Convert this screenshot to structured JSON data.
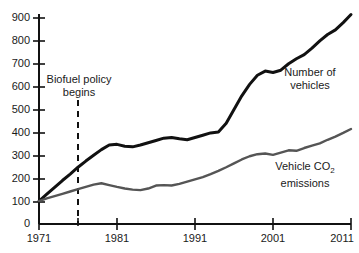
{
  "chart_data": {
    "type": "line",
    "title": "",
    "xlabel": "",
    "ylabel": "",
    "xlim": [
      1971,
      2011
    ],
    "ylim": [
      0,
      900
    ],
    "grid": false,
    "legend_position": "inline-right",
    "x_tick_labels": [
      "1971",
      "1981",
      "1991",
      "2001",
      "2011"
    ],
    "x_ticks": [
      1971,
      1981,
      1991,
      2001,
      2011
    ],
    "y_tick_labels": [
      "0",
      "100",
      "200",
      "300",
      "400",
      "500",
      "600",
      "700",
      "800",
      "900"
    ],
    "y_ticks": [
      0,
      100,
      200,
      300,
      400,
      500,
      600,
      700,
      800,
      900
    ],
    "x": [
      1971,
      1972,
      1973,
      1974,
      1975,
      1976,
      1977,
      1978,
      1979,
      1980,
      1981,
      1982,
      1983,
      1984,
      1985,
      1986,
      1987,
      1988,
      1989,
      1990,
      1991,
      1992,
      1993,
      1994,
      1995,
      1996,
      1997,
      1998,
      1999,
      2000,
      2001,
      2002,
      2003,
      2004,
      2005,
      2006,
      2007,
      2008,
      2009,
      2010,
      2011
    ],
    "series": [
      {
        "name": "Number of vehicles",
        "color": "#111111",
        "values": [
          100,
          130,
          160,
          190,
          218,
          248,
          275,
          300,
          325,
          345,
          348,
          340,
          337,
          345,
          355,
          365,
          375,
          378,
          372,
          368,
          378,
          388,
          398,
          402,
          440,
          500,
          560,
          610,
          650,
          668,
          662,
          672,
          700,
          722,
          740,
          768,
          800,
          828,
          848,
          880,
          915
        ]
      },
      {
        "name": "Vehicle CO2 emissions",
        "color": "#555555",
        "values": [
          100,
          112,
          122,
          132,
          142,
          152,
          162,
          172,
          178,
          170,
          162,
          155,
          150,
          148,
          155,
          168,
          170,
          168,
          175,
          185,
          195,
          205,
          218,
          232,
          248,
          265,
          282,
          296,
          305,
          308,
          302,
          312,
          322,
          320,
          332,
          342,
          352,
          368,
          382,
          398,
          415
        ]
      }
    ],
    "annotations": [
      {
        "name": "biofuel-policy-marker",
        "text_line1": "Biofuel policy",
        "text_line2": "begins",
        "x_value": 1976,
        "style": "dashed-vertical"
      }
    ],
    "series_labels": [
      {
        "line1": "Number of",
        "line2": "vehicles"
      },
      {
        "line1": "Vehicle CO",
        "sub": "2",
        "line2": "emissions"
      }
    ]
  },
  "colors": {
    "axis": "#111111",
    "background": "#ffffff",
    "text": "#1a1a1a",
    "series_black": "#111111",
    "series_gray": "#555555"
  }
}
